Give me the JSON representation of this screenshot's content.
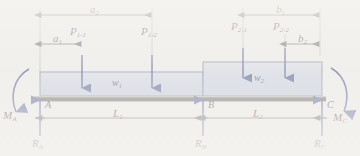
{
  "figure": {
    "type": "structural-free-body-diagram"
  },
  "labels": {
    "a1": "a",
    "a1_sub": "1",
    "a2": "a",
    "a2_sub": "2",
    "b1": "b",
    "b1_sub": "1",
    "b2": "b",
    "b2_sub": "2",
    "L1": "L",
    "L1_sub": "1",
    "L2": "L",
    "L2_sub": "2",
    "P11": "P",
    "P11_sub": "1-1",
    "P12": "P",
    "P12_sub": "1-2",
    "P21": "P",
    "P21_sub": "2-1",
    "P22": "P",
    "P22_sub": "2-2",
    "w1": "w",
    "w1_sub": "1",
    "w2": "w",
    "w2_sub": "2",
    "A": "A",
    "B": "B",
    "C": "C",
    "MA": "M",
    "MA_sub": "A",
    "MC": "M",
    "MC_sub": "C",
    "RA": "R",
    "RA_sub": "A",
    "RB": "R",
    "RB_sub": "B",
    "RC": "R",
    "RC_sub": "C"
  },
  "colors": {
    "background": "#f4f2ef",
    "load_block_fill": "#c6cfe4",
    "load_block_edge": "#5a6a9a",
    "beam_fill": "#4a4a4a",
    "force_arrow": "#2d3f86",
    "dimension_line": "#4a4a4a",
    "text": "#17171c"
  },
  "geometry": {
    "beam": {
      "x_left": 40,
      "x_right": 322,
      "y_top": 96,
      "y_bottom": 101
    },
    "supports": {
      "A_x": 40,
      "B_x": 203,
      "C_x": 322
    },
    "load_block_w1": {
      "x": 40,
      "y": 72,
      "width": 163,
      "height": 24
    },
    "load_block_w2": {
      "x": 203,
      "y": 62,
      "width": 119,
      "height": 34
    },
    "point_loads": [
      {
        "name": "P1-1",
        "x": 82
      },
      {
        "name": "P1-2",
        "x": 152
      },
      {
        "name": "P2-1",
        "x": 243
      },
      {
        "name": "P2-2",
        "x": 285
      }
    ],
    "dimensions": [
      {
        "name": "a2",
        "x_start": 40,
        "x_end": 152,
        "y": 15
      },
      {
        "name": "a1",
        "x_start": 40,
        "x_end": 82,
        "y": 44
      },
      {
        "name": "b1",
        "x_start": 243,
        "x_end": 320,
        "y": 15
      },
      {
        "name": "b2",
        "x_start": 285,
        "x_end": 320,
        "y": 44
      },
      {
        "name": "L1",
        "x_start": 40,
        "x_end": 203,
        "y": 118
      },
      {
        "name": "L2",
        "x_start": 203,
        "x_end": 322,
        "y": 118
      }
    ],
    "moments": [
      {
        "name": "MA",
        "direction": "counterclockwise",
        "x": 22,
        "y": 95
      },
      {
        "name": "MC",
        "direction": "clockwise",
        "x": 340,
        "y": 95
      }
    ]
  }
}
